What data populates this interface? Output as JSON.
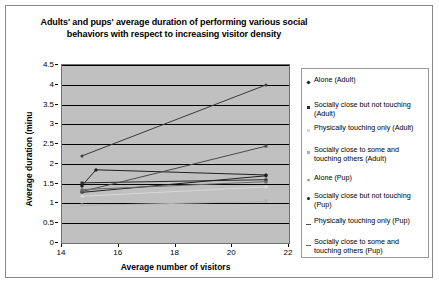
{
  "chart_data": {
    "type": "line",
    "title": "Adults' and pups' average duration of performing various social behaviors with respect to increasing visitor density",
    "xlabel": "Average number of visitors",
    "ylabel": "Average duration (minu",
    "xlim": [
      14,
      22
    ],
    "ylim": [
      0,
      4.5
    ],
    "x_ticks": [
      14,
      16,
      18,
      20,
      22
    ],
    "y_ticks": [
      0,
      0.5,
      1,
      1.5,
      2,
      2.5,
      3,
      3.5,
      4,
      4.5
    ],
    "grid": true,
    "legend_position": "right",
    "plot_background": "#c0c0c0",
    "x": [
      14.7,
      15.2,
      21.2
    ],
    "series": [
      {
        "name": "Alone (Adult)",
        "marker": "diamond",
        "color": "#202020",
        "points": [
          [
            14.7,
            1.45
          ],
          [
            15.2,
            1.85
          ],
          [
            21.2,
            1.72
          ]
        ]
      },
      {
        "name": "Socially close but not touching (Adult)",
        "marker": "square",
        "color": "#2a2a2a",
        "points": [
          [
            14.7,
            1.52
          ],
          [
            21.2,
            1.6
          ]
        ]
      },
      {
        "name": "Physically touching only (Adult)",
        "marker": "square",
        "color": "#d8d8d8",
        "points": [
          [
            14.7,
            1.18
          ],
          [
            21.2,
            1.42
          ]
        ]
      },
      {
        "name": "Socially close to some and touching others (Adult)",
        "marker": "square",
        "color": "#b0b0b0",
        "points": [
          [
            14.7,
            0.95
          ],
          [
            21.2,
            1.05
          ]
        ]
      },
      {
        "name": "Alone (Pup)",
        "marker": "x",
        "color": "#3a3a3a",
        "points": [
          [
            14.7,
            2.2
          ],
          [
            21.2,
            4.0
          ]
        ]
      },
      {
        "name": "Socially close but not touching (Pup)",
        "marker": "circle",
        "color": "#1f1f1f",
        "points": [
          [
            14.7,
            1.28
          ],
          [
            21.2,
            1.7
          ]
        ]
      },
      {
        "name": "Physically touching only (Pup)",
        "marker": "dash",
        "color": "#4a4a4a",
        "points": [
          [
            14.7,
            1.3
          ],
          [
            21.2,
            2.45
          ]
        ]
      },
      {
        "name": "Socially close to some and touching others (Pup)",
        "marker": "dash",
        "color": "#6a6a6a",
        "points": [
          [
            14.7,
            1.35
          ],
          [
            21.2,
            1.55
          ]
        ]
      }
    ]
  },
  "legend": {
    "entries": [
      {
        "label": "Alone (Adult)",
        "marker": "diamond",
        "color": "#202020"
      },
      {
        "label": "Socially close but not touching (Adult)",
        "marker": "square",
        "color": "#2a2a2a"
      },
      {
        "label": "Physically touching only (Adult)",
        "marker": "square",
        "color": "#d8d8d8"
      },
      {
        "label": "Socially close to some and touching others (Adult)",
        "marker": "square",
        "color": "#b0b0b0"
      },
      {
        "label": "Alone (Pup)",
        "marker": "x",
        "color": "#3a3a3a"
      },
      {
        "label": "Socially close but not touching (Pup)",
        "marker": "circle",
        "color": "#1f1f1f"
      },
      {
        "label": "Physically touching only (Pup)",
        "marker": "dash",
        "color": "#4a4a4a"
      },
      {
        "label": "Socially close to some and touching others (Pup)",
        "marker": "dash",
        "color": "#6a6a6a"
      }
    ]
  }
}
